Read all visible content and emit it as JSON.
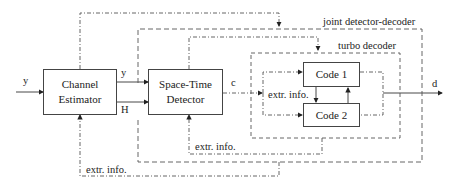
{
  "diagram": {
    "blocks": {
      "channel_estimator": {
        "line1": "Channel",
        "line2": "Estimator"
      },
      "space_time_detector": {
        "line1": "Space-Time",
        "line2": "Detector"
      },
      "code1": {
        "label": "Code 1"
      },
      "code2": {
        "label": "Code 2"
      }
    },
    "groups": {
      "joint": "joint detector-decoder",
      "turbo": "turbo decoder"
    },
    "signals": {
      "input_y": "y",
      "y_out": "y",
      "H_out": "H",
      "c": "c",
      "d": "d",
      "extr_inner": "extr. info.",
      "extr_detector": "extr. info.",
      "extr_estimator": "extr. info."
    }
  }
}
